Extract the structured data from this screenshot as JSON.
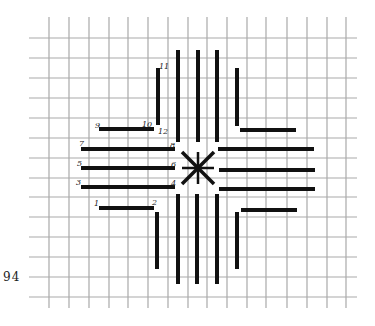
{
  "page": {
    "number": "94"
  },
  "grid": {
    "color": "#a9a9a9",
    "vertical_x": [
      49,
      69,
      89,
      109,
      128,
      148,
      168,
      188,
      207,
      227,
      247,
      266,
      287,
      307,
      327,
      346
    ],
    "horizontal_y": [
      38,
      58,
      78,
      98,
      118,
      138,
      158,
      178,
      197,
      217,
      237,
      257,
      277,
      297
    ],
    "v_top": 17,
    "v_bottom": 308,
    "h_left": 29,
    "h_right": 357
  },
  "stitch_color": "#111111",
  "stitches": {
    "left_horizontal": [
      {
        "x1": 99,
        "x2": 154,
        "y": 129,
        "start_label": "9",
        "end_label": "10"
      },
      {
        "x1": 81,
        "x2": 175,
        "y": 149,
        "start_label": "7",
        "end_label": "8"
      },
      {
        "x1": 81,
        "x2": 175,
        "y": 168,
        "start_label": "5",
        "end_label": "6"
      },
      {
        "x1": 81,
        "x2": 175,
        "y": 187,
        "start_label": "3",
        "end_label": "4"
      },
      {
        "x1": 99,
        "x2": 154,
        "y": 208,
        "start_label": "1",
        "end_label": "2"
      }
    ],
    "right_horizontal": [
      {
        "x1": 240,
        "x2": 296,
        "y": 130
      },
      {
        "x1": 218,
        "x2": 314,
        "y": 149
      },
      {
        "x1": 219,
        "x2": 315,
        "y": 170
      },
      {
        "x1": 219,
        "x2": 315,
        "y": 189
      },
      {
        "x1": 241,
        "x2": 297,
        "y": 210
      }
    ],
    "top_vertical": [
      {
        "x": 158,
        "y1": 68,
        "y2": 125,
        "start_label": "11",
        "end_label": "12"
      },
      {
        "x": 178,
        "y1": 50,
        "y2": 142
      },
      {
        "x": 198,
        "y1": 50,
        "y2": 142
      },
      {
        "x": 217,
        "y1": 50,
        "y2": 142
      },
      {
        "x": 237,
        "y1": 68,
        "y2": 126
      }
    ],
    "bottom_vertical": [
      {
        "x": 157,
        "y1": 212,
        "y2": 269
      },
      {
        "x": 178,
        "y1": 194,
        "y2": 284
      },
      {
        "x": 197,
        "y1": 194,
        "y2": 284
      },
      {
        "x": 217,
        "y1": 194,
        "y2": 284
      },
      {
        "x": 237,
        "y1": 212,
        "y2": 269
      }
    ],
    "center_star": {
      "cx": 198,
      "cy": 168,
      "arm": 16
    }
  },
  "labels": [
    {
      "text": "9",
      "x": 95,
      "y": 128
    },
    {
      "text": "10",
      "x": 142,
      "y": 127
    },
    {
      "text": "12",
      "x": 158,
      "y": 134
    },
    {
      "text": "11",
      "x": 159,
      "y": 69
    },
    {
      "text": "7",
      "x": 79,
      "y": 146
    },
    {
      "text": "8",
      "x": 170,
      "y": 148
    },
    {
      "text": "5",
      "x": 77,
      "y": 166
    },
    {
      "text": "6",
      "x": 171,
      "y": 167
    },
    {
      "text": "3",
      "x": 76,
      "y": 185
    },
    {
      "text": "4",
      "x": 171,
      "y": 186
    },
    {
      "text": "1",
      "x": 94,
      "y": 206
    },
    {
      "text": "2",
      "x": 152,
      "y": 205
    }
  ]
}
